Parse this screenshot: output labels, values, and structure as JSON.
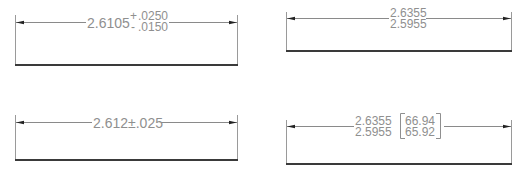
{
  "colors": {
    "text": "#8f8f8f",
    "dimension_line": "#8a8a8a",
    "baseline": "#3a3a3a",
    "arrow": "#222222",
    "background": "#ffffff"
  },
  "panels": [
    {
      "id": "deviation-tolerance",
      "nominal": "2.6105",
      "upper_sign": "+",
      "upper": ".0250",
      "lower_sign": "-",
      "lower": ".0150"
    },
    {
      "id": "limit-dimension",
      "upper_limit": "2.6355",
      "lower_limit": "2.5955"
    },
    {
      "id": "symmetric-tolerance",
      "text": "2.612±.025"
    },
    {
      "id": "dual-dimension-limits",
      "upper_limit": "2.6355",
      "lower_limit": "2.5955",
      "alt_upper": "66.94",
      "alt_lower": "65.92"
    }
  ]
}
